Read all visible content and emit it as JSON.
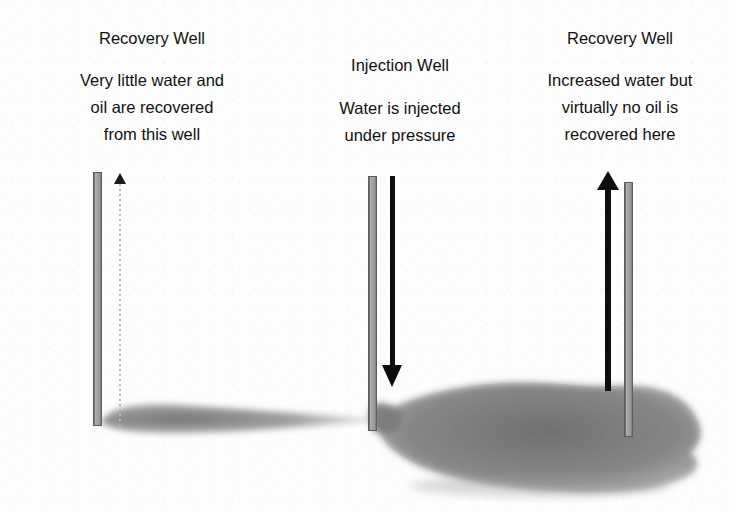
{
  "figure": {
    "title_alt": "Waterflood sweep diagram showing oil plume between recovery and injection wells",
    "background_color": "#fdfdfd",
    "plume_color": "#808080",
    "casing_color": "#a0a0a0",
    "arrow_color": "#0d0d0d",
    "text_color": "#111111"
  },
  "annotations": {
    "left": {
      "title": "Recovery Well",
      "body": [
        "Very little water and",
        "oil are recovered",
        "from this well"
      ]
    },
    "center": {
      "title": "Injection Well",
      "body": [
        "Water is injected",
        "under pressure"
      ]
    },
    "right": {
      "title": "Recovery Well",
      "body": [
        "Increased water but",
        "virtually no oil is",
        "recovered here"
      ]
    }
  },
  "wells": [
    {
      "id": "left-recovery-well",
      "label": "Recovery Well",
      "casing": {
        "x": 93,
        "y": 172,
        "width": 9,
        "height": 254
      },
      "flow_arrow": {
        "direction": "up",
        "style": "dotted-faint",
        "x": 120,
        "top": 174,
        "bottom": 425,
        "meaning": "minimal fluid recovery"
      }
    },
    {
      "id": "injection-well",
      "label": "Injection Well",
      "casing": {
        "x": 368,
        "y": 176,
        "width": 9,
        "height": 255
      },
      "flow_arrow": {
        "direction": "down",
        "style": "solid-bold",
        "x": 392,
        "top": 176,
        "bottom": 387,
        "meaning": "water injected under pressure"
      }
    },
    {
      "id": "right-recovery-well",
      "label": "Recovery Well",
      "casing": {
        "x": 624,
        "y": 182,
        "width": 9,
        "height": 255
      },
      "flow_arrow": {
        "direction": "up",
        "style": "solid-bold",
        "x": 608,
        "top": 171,
        "bottom": 391,
        "meaning": "increased water recovered, virtually no oil"
      }
    }
  ],
  "plumes": [
    {
      "id": "left-residual-oil-lens",
      "description": "thin tapering residual oil lens from left recovery well toward injection well",
      "extent_x": [
        100,
        376
      ],
      "center_y": 418,
      "max_thickness": 22
    },
    {
      "id": "right-swept-oil-bank",
      "description": "large swept oil bank displaced to the right of the injection well",
      "extent_x": [
        374,
        702
      ],
      "extent_y": [
        384,
        492
      ]
    }
  ]
}
